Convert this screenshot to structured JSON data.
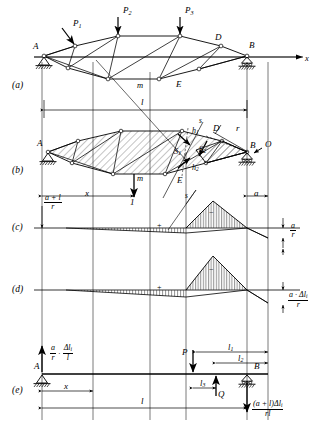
{
  "figure": {
    "panels": [
      {
        "id": "a",
        "label": "(a)"
      },
      {
        "id": "b",
        "label": "(b)"
      },
      {
        "id": "c",
        "label": "(c)"
      },
      {
        "id": "d",
        "label": "(d)"
      },
      {
        "id": "e",
        "label": "(e)"
      }
    ]
  },
  "panel_a": {
    "loads": [
      "P",
      "P",
      "P"
    ],
    "load_subs": [
      "1",
      "2",
      "3"
    ],
    "nodes": {
      "left_support": "A",
      "right_support": "B",
      "top_right": "D",
      "bottom_mid": "m",
      "bottom_right": "E"
    },
    "axis_label": "x"
  },
  "panel_b": {
    "nodes": {
      "left_support": "A",
      "right_support": "B",
      "panel_point": "D",
      "bottom_mid": "m",
      "bottom_right": "E",
      "pole": "O"
    },
    "forces": {
      "s1": "S",
      "s1_sub": "1",
      "s2": "S",
      "s2_sub": "2"
    },
    "levers": {
      "h1": "h",
      "h1_sub": "1",
      "h2": "h",
      "h2_sub": "2"
    },
    "radius": "r",
    "section_line": "s",
    "unit_load": "1",
    "dims": {
      "span": "l",
      "overhang": "a",
      "x": "x"
    }
  },
  "panel_c": {
    "left_ordinate": {
      "num": "a + l",
      "den": "r"
    },
    "right_ordinate": {
      "num": "a",
      "den": "r"
    },
    "signs": {
      "positive": "+",
      "negative": "−"
    },
    "markers": {
      "section": "s",
      "node": "E",
      "mid": "m",
      "unit_load": "1",
      "dim_x": "x",
      "dim_a": "a"
    }
  },
  "panel_d": {
    "right_ordinate": {
      "num": "a · Δl",
      "num_sub": "i",
      "den": "r"
    },
    "signs": {
      "positive": "+",
      "negative": "−"
    }
  },
  "panel_e": {
    "nodes": {
      "left_support": "A",
      "right_support": "B"
    },
    "left_reaction": {
      "f1_num": "a",
      "f1_den": "r",
      "dot": "·",
      "f2_num": "Δl",
      "f2_num_sub": "i",
      "f2_den": "l"
    },
    "right_reaction": {
      "num": "(a + l)Δl",
      "num_sub": "i",
      "den": "rl"
    },
    "loads": {
      "p": "P",
      "q": "Q"
    },
    "dims": {
      "x": "x",
      "span": "l",
      "l1": "l",
      "l1_sub": "1",
      "l2": "l",
      "l2_sub": "2",
      "l3": "l",
      "l3_sub": "3"
    }
  },
  "colors": {
    "ink": "#1a1a1a",
    "hatch": "#3a3a3a",
    "rule": "#000000"
  }
}
